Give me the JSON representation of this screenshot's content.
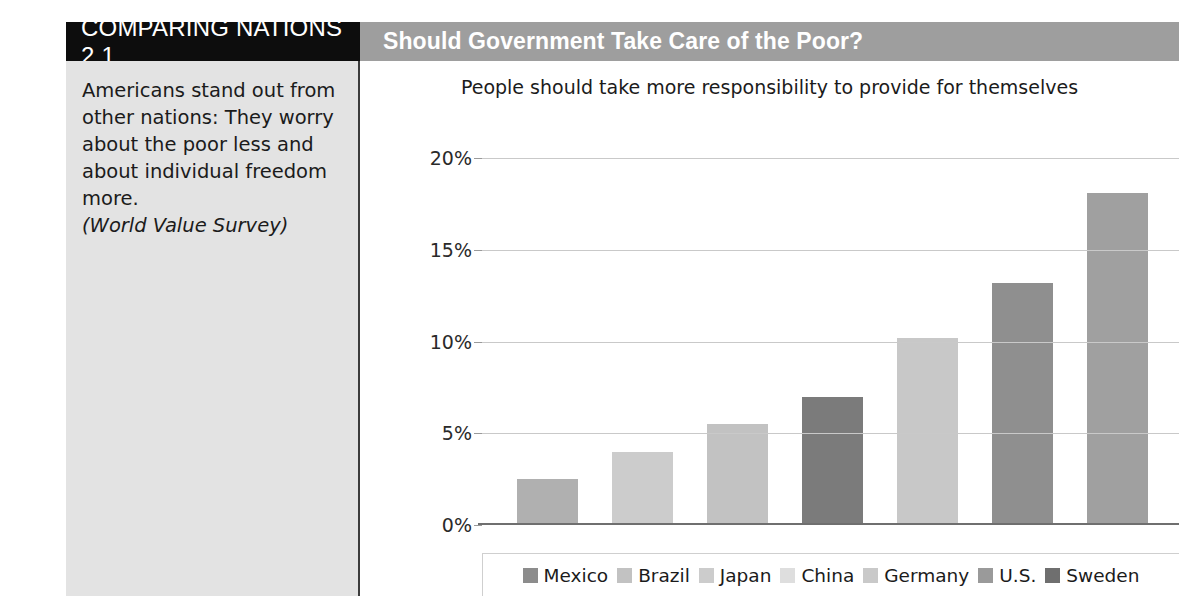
{
  "header": {
    "tag": "COMPARING NATIONS 2.1",
    "title": "Should Government Take Care of the Poor?"
  },
  "sidebar": {
    "caption": "Americans stand out from other nations: They worry about the poor less and about individual freedom more.",
    "source": "(World Value Survey)"
  },
  "chart_data": {
    "type": "bar",
    "title": "People should take more responsibility to provide for themselves",
    "xlabel": "",
    "ylabel": "",
    "ylim": [
      0,
      20
    ],
    "grid": true,
    "legend_position": "bottom",
    "tick_labels": [
      "20%",
      "15%",
      "10%",
      "5%",
      "0%"
    ],
    "tick_values": [
      20,
      15,
      10,
      5,
      0
    ],
    "categories": [
      "Mexico",
      "Brazil",
      "Japan",
      "China",
      "Germany",
      "U.S.",
      "Sweden"
    ],
    "values": [
      2.5,
      4.0,
      5.5,
      7.0,
      10.2,
      13.2,
      18.1
    ],
    "colors": [
      "#b0b0b0",
      "#cccccc",
      "#c2c2c2",
      "#7b7b7b",
      "#c8c8c8",
      "#8f8f8f",
      "#a0a0a0"
    ],
    "legend": [
      {
        "label": "Mexico",
        "color": "#8c8c8c"
      },
      {
        "label": "Brazil",
        "color": "#c2c2c2"
      },
      {
        "label": "Japan",
        "color": "#cccccc"
      },
      {
        "label": "China",
        "color": "#dedede"
      },
      {
        "label": "Germany",
        "color": "#c9c9c9"
      },
      {
        "label": "U.S.",
        "color": "#9a9a9a"
      },
      {
        "label": "Sweden",
        "color": "#6f6f6f"
      }
    ]
  }
}
